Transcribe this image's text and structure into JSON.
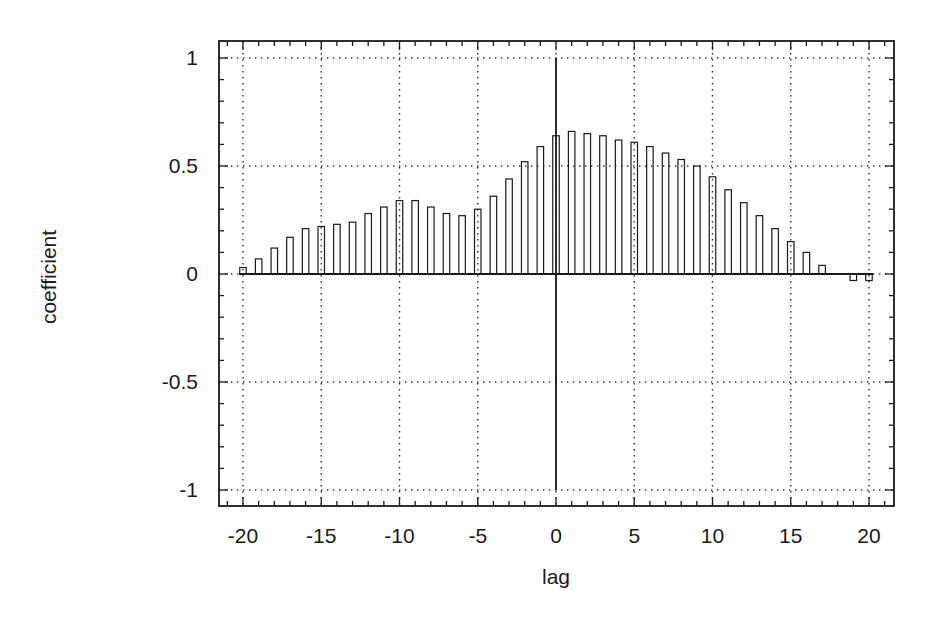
{
  "chart_data": {
    "type": "bar",
    "title": "",
    "xlabel": "lag",
    "ylabel": "coefficient",
    "xlim": [
      -22,
      22.5
    ],
    "ylim": [
      -1.08,
      1.16
    ],
    "xticks": [
      -20,
      -15,
      -10,
      -5,
      0,
      5,
      10,
      15,
      20
    ],
    "xtick_labels": [
      "-20",
      "-15",
      "-10",
      "-5",
      "0",
      "5",
      "10",
      "15",
      "20"
    ],
    "yticks": [
      -1,
      -0.5,
      0,
      0.5,
      1
    ],
    "ytick_labels": [
      "-1",
      "-0.5",
      "0",
      "0.5",
      "1"
    ],
    "x_minor_step": 1,
    "y_minor_step": 0.1,
    "grid": true,
    "grid_style": "dotted",
    "legend": null,
    "zero_line": true,
    "vertical_line_at_x": 0,
    "x": [
      -20,
      -19,
      -18,
      -17,
      -16,
      -15,
      -14,
      -13,
      -12,
      -11,
      -10,
      -9,
      -8,
      -7,
      -6,
      -5,
      -4,
      -3,
      -2,
      -1,
      0,
      1,
      2,
      3,
      4,
      5,
      6,
      7,
      8,
      9,
      10,
      11,
      12,
      13,
      14,
      15,
      16,
      17,
      18,
      19,
      20
    ],
    "values": [
      0.03,
      0.07,
      0.12,
      0.17,
      0.21,
      0.22,
      0.23,
      0.24,
      0.28,
      0.31,
      0.34,
      0.34,
      0.31,
      0.28,
      0.27,
      0.3,
      0.36,
      0.44,
      0.52,
      0.59,
      0.64,
      0.66,
      0.65,
      0.64,
      0.62,
      0.61,
      0.59,
      0.56,
      0.53,
      0.5,
      0.45,
      0.39,
      0.33,
      0.27,
      0.21,
      0.15,
      0.1,
      0.04,
      0.0,
      -0.03,
      -0.03
    ]
  },
  "colors": {
    "ink": "#1a1a1a",
    "grid": "#333333",
    "background": "#ffffff"
  }
}
